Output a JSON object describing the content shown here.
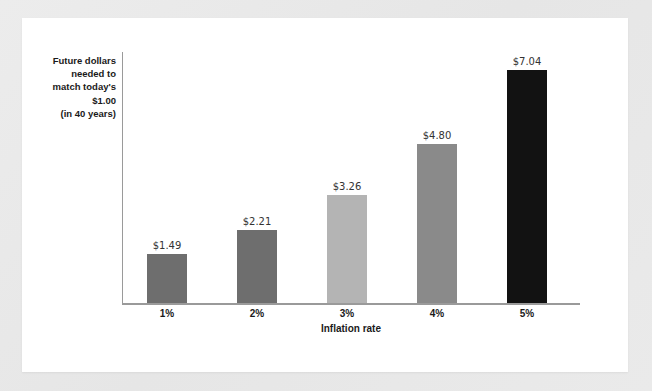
{
  "chart_data": {
    "type": "bar",
    "title": "",
    "categories": [
      "1%",
      "2%",
      "3%",
      "4%",
      "5%"
    ],
    "values": [
      1.49,
      2.21,
      3.26,
      4.8,
      7.04
    ],
    "value_labels": [
      "$1.49",
      "$2.21",
      "$3.26",
      "$4.80",
      "$7.04"
    ],
    "bar_colors": [
      "#6e6e6e",
      "#6e6e6e",
      "#b4b4b4",
      "#8a8a8a",
      "#121212"
    ],
    "xlabel": "Inflation rate",
    "ylabel_lines": [
      "Future dollars",
      "needed to",
      "match today's",
      "$1.00",
      "(in 40 years)"
    ],
    "ylim": [
      0,
      7.6
    ],
    "grid": false,
    "legend": false
  },
  "axis": {
    "line_color": "#9a9a9a"
  },
  "canvas": {
    "background": "#e9e9e9",
    "card_background": "#ffffff"
  }
}
